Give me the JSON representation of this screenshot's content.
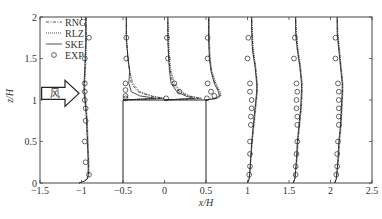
{
  "chart_data": {
    "type": "line",
    "title": "",
    "xlabel": "x/H",
    "ylabel": "z/H",
    "xlim": [
      -1.5,
      2.5
    ],
    "ylim": [
      0,
      2
    ],
    "xticks": [
      -1.5,
      -1,
      -0.5,
      0,
      0.5,
      1,
      1.5,
      2,
      2.5
    ],
    "xtick_labels": [
      "-1.5",
      "-1",
      "-0.5",
      "0",
      "0.5",
      "1",
      "1.5",
      "2",
      "2.5"
    ],
    "yticks": [
      0,
      0.5,
      1,
      1.5,
      2
    ],
    "ytick_labels": [
      "0",
      "0.5",
      "1",
      "1.5",
      "2"
    ],
    "grid": false,
    "legend": {
      "position": "upper left",
      "entries": [
        {
          "label": "RNG",
          "style": "dash-dot"
        },
        {
          "label": "RLZ",
          "style": "dotted"
        },
        {
          "label": "SKE",
          "style": "solid"
        },
        {
          "label": "EXP",
          "style": "circle-marker"
        }
      ]
    },
    "building": {
      "x0": -0.5,
      "x1": 0.5,
      "z0": 0,
      "z1": 1
    },
    "wind_arrow": {
      "label": "风",
      "z": 1.08,
      "x_start": -1.48,
      "x_end": -1.03
    },
    "profiles": [
      {
        "station": -1.0,
        "z": [
          0,
          0.02,
          0.05,
          0.1,
          0.25,
          0.5,
          0.75,
          0.9,
          1.0,
          1.1,
          1.2,
          1.4,
          1.7,
          2.0
        ],
        "SKE": [
          -1.03,
          -0.97,
          -0.93,
          -0.92,
          -0.92,
          -0.93,
          -0.94,
          -0.95,
          -0.96,
          -0.97,
          -0.97,
          -0.96,
          -0.95,
          -0.95
        ],
        "RLZ": [
          -1.03,
          -0.97,
          -0.93,
          -0.91,
          -0.91,
          -0.92,
          -0.93,
          -0.94,
          -0.95,
          -0.96,
          -0.96,
          -0.95,
          -0.94,
          -0.94
        ],
        "RNG": [
          -1.03,
          -0.97,
          -0.93,
          -0.915,
          -0.915,
          -0.925,
          -0.935,
          -0.945,
          -0.955,
          -0.965,
          -0.965,
          -0.955,
          -0.945,
          -0.945
        ],
        "EXP_z": [
          0.1,
          0.25,
          0.5,
          0.75,
          0.9,
          1.0,
          1.1,
          1.2,
          1.5,
          1.75
        ],
        "EXP_x": [
          -0.91,
          -0.95,
          -0.96,
          -0.95,
          -0.95,
          -0.96,
          -0.96,
          -0.96,
          -0.96,
          -0.91
        ]
      },
      {
        "station": -0.5,
        "z": [
          1.0,
          1.02,
          1.05,
          1.1,
          1.2,
          1.35,
          1.5,
          1.75,
          2.0
        ],
        "SKE": [
          -0.5,
          -0.1,
          -0.3,
          -0.4,
          -0.43,
          -0.42,
          -0.44,
          -0.46,
          -0.46
        ],
        "RLZ": [
          -0.5,
          0.0,
          -0.15,
          -0.3,
          -0.38,
          -0.42,
          -0.44,
          -0.46,
          -0.46
        ],
        "RNG": [
          -0.5,
          -0.02,
          -0.18,
          -0.32,
          -0.4,
          -0.42,
          -0.44,
          -0.46,
          -0.46
        ],
        "EXP_z": [
          1.02,
          1.05,
          1.12,
          1.2,
          1.5,
          1.75
        ],
        "EXP_x": [
          -0.47,
          -0.47,
          -0.47,
          -0.47,
          -0.46,
          -0.46
        ]
      },
      {
        "station": 0.0,
        "z": [
          1.0,
          1.02,
          1.05,
          1.1,
          1.2,
          1.35,
          1.5,
          1.75,
          2.0
        ],
        "SKE": [
          0.0,
          0.35,
          0.25,
          0.15,
          0.08,
          0.06,
          0.05,
          0.04,
          0.04
        ],
        "RLZ": [
          0.0,
          0.45,
          0.3,
          0.2,
          0.12,
          0.08,
          0.06,
          0.05,
          0.04
        ],
        "RNG": [
          0.0,
          0.42,
          0.28,
          0.18,
          0.1,
          0.07,
          0.05,
          0.04,
          0.04
        ],
        "EXP_z": [
          1.02,
          1.1,
          1.2,
          1.5,
          1.75
        ],
        "EXP_x": [
          0.02,
          0.18,
          0.12,
          0.04,
          0.03
        ]
      },
      {
        "station": 0.5,
        "z": [
          1.0,
          1.02,
          1.05,
          1.1,
          1.2,
          1.35,
          1.5,
          1.75,
          2.0
        ],
        "SKE": [
          0.5,
          0.62,
          0.66,
          0.65,
          0.6,
          0.56,
          0.54,
          0.53,
          0.53
        ],
        "RLZ": [
          0.5,
          0.64,
          0.68,
          0.67,
          0.62,
          0.57,
          0.55,
          0.54,
          0.54
        ],
        "RNG": [
          0.5,
          0.63,
          0.67,
          0.66,
          0.61,
          0.565,
          0.545,
          0.535,
          0.535
        ],
        "EXP_z": [
          1.02,
          1.05,
          1.1,
          1.2,
          1.5,
          1.75
        ],
        "EXP_x": [
          0.51,
          0.6,
          0.56,
          0.52,
          0.52,
          0.52
        ]
      },
      {
        "station": 1.0,
        "z": [
          0,
          0.05,
          0.15,
          0.3,
          0.5,
          0.7,
          0.9,
          1.1,
          1.2,
          1.4,
          1.6,
          1.8,
          2.0
        ],
        "SKE": [
          1.0,
          1.02,
          1.03,
          1.04,
          1.05,
          1.07,
          1.09,
          1.11,
          1.11,
          1.09,
          1.06,
          1.05,
          1.05
        ],
        "RLZ": [
          1.0,
          1.02,
          1.03,
          1.04,
          1.06,
          1.08,
          1.1,
          1.12,
          1.12,
          1.1,
          1.07,
          1.06,
          1.05
        ],
        "RNG": [
          1.0,
          1.02,
          1.03,
          1.04,
          1.055,
          1.075,
          1.095,
          1.115,
          1.115,
          1.095,
          1.065,
          1.055,
          1.05
        ],
        "EXP_z": [
          0.1,
          0.2,
          0.35,
          0.5,
          0.7,
          0.8,
          0.9,
          1.0,
          1.1,
          1.2,
          1.5,
          1.75
        ],
        "EXP_x": [
          1.02,
          1.03,
          1.03,
          1.03,
          1.04,
          1.04,
          1.05,
          1.05,
          1.03,
          1.03,
          1.0,
          1.01
        ]
      },
      {
        "station": 1.5,
        "z": [
          0,
          0.05,
          0.15,
          0.3,
          0.5,
          0.7,
          0.9,
          1.1,
          1.2,
          1.4,
          1.6,
          1.8,
          2.0
        ],
        "SKE": [
          1.55,
          1.57,
          1.58,
          1.59,
          1.6,
          1.62,
          1.64,
          1.65,
          1.65,
          1.63,
          1.6,
          1.58,
          1.58
        ],
        "RLZ": [
          1.55,
          1.57,
          1.58,
          1.6,
          1.61,
          1.63,
          1.65,
          1.66,
          1.66,
          1.64,
          1.61,
          1.59,
          1.58
        ],
        "RNG": [
          1.55,
          1.57,
          1.58,
          1.595,
          1.605,
          1.625,
          1.645,
          1.655,
          1.655,
          1.635,
          1.605,
          1.585,
          1.58
        ],
        "EXP_z": [
          0.1,
          0.2,
          0.35,
          0.5,
          0.7,
          0.8,
          0.9,
          1.0,
          1.1,
          1.2,
          1.5,
          1.75
        ],
        "EXP_x": [
          1.58,
          1.58,
          1.59,
          1.6,
          1.6,
          1.6,
          1.59,
          1.59,
          1.6,
          1.59,
          1.56,
          1.57
        ]
      },
      {
        "station": 2.0,
        "z": [
          0,
          0.05,
          0.15,
          0.3,
          0.5,
          0.7,
          0.9,
          1.1,
          1.2,
          1.4,
          1.6,
          1.8,
          2.0
        ],
        "SKE": [
          2.05,
          2.07,
          2.08,
          2.09,
          2.1,
          2.12,
          2.13,
          2.14,
          2.14,
          2.12,
          2.1,
          2.08,
          2.08
        ],
        "RLZ": [
          2.05,
          2.07,
          2.08,
          2.1,
          2.11,
          2.13,
          2.14,
          2.15,
          2.15,
          2.13,
          2.11,
          2.09,
          2.08
        ],
        "RNG": [
          2.05,
          2.07,
          2.08,
          2.095,
          2.105,
          2.125,
          2.135,
          2.145,
          2.145,
          2.125,
          2.105,
          2.085,
          2.08
        ],
        "EXP_z": [
          0.1,
          0.2,
          0.35,
          0.5,
          0.7,
          0.8,
          0.9,
          1.0,
          1.1,
          1.2,
          1.5,
          1.75
        ],
        "EXP_x": [
          2.07,
          2.08,
          2.08,
          2.09,
          2.1,
          2.1,
          2.1,
          2.1,
          2.1,
          2.09,
          2.06,
          2.06
        ]
      }
    ]
  },
  "colors": {
    "line": "#222222",
    "frame": "#444444",
    "text": "#333333",
    "background": "#ffffff"
  }
}
